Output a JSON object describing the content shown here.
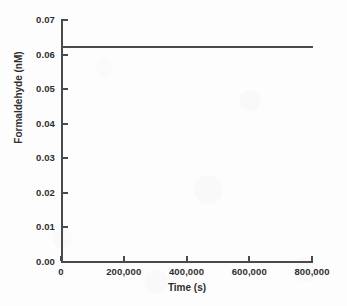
{
  "chart_data": {
    "type": "line",
    "title": "",
    "subtitle": "",
    "xlabel": "Time (s)",
    "ylabel": "Formaldehyde (nM)",
    "xlim": [
      0,
      800000
    ],
    "ylim": [
      0.0,
      0.07
    ],
    "grid": false,
    "legend": "none",
    "x_ticks": [
      0,
      200000,
      400000,
      600000,
      800000
    ],
    "x_tick_labels": [
      "0",
      "200,000",
      "400,000",
      "600,000",
      "800,000"
    ],
    "y_ticks": [
      0.0,
      0.01,
      0.02,
      0.03,
      0.04,
      0.05,
      0.06,
      0.07
    ],
    "y_tick_labels": [
      "0.00",
      "0.01",
      "0.02",
      "0.03",
      "0.04",
      "0.05",
      "0.06",
      "0.07"
    ],
    "series": [
      {
        "name": "Formaldehyde",
        "color": "#4a4a4a",
        "x": [
          0,
          100000,
          200000,
          300000,
          400000,
          500000,
          600000,
          700000,
          800000
        ],
        "values": [
          0.0623,
          0.0623,
          0.0623,
          0.0623,
          0.0623,
          0.0623,
          0.0623,
          0.0623,
          0.0623
        ]
      }
    ],
    "annotations": []
  },
  "figure": {
    "background_color": "#fdfdfd",
    "axis_color": "#4a4a4a",
    "text_color": "#2e2e2e"
  }
}
